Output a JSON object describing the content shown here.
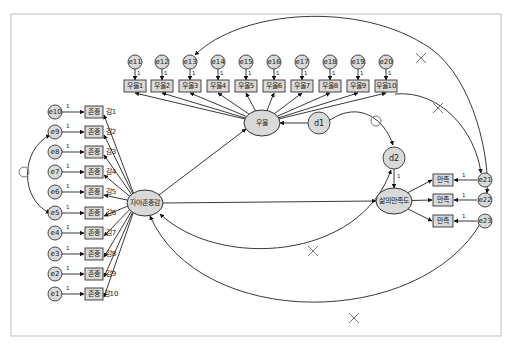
{
  "diagram": {
    "type": "SEM path diagram",
    "latents": {
      "self_esteem": {
        "label": "자아존중감",
        "cx": 145,
        "cy": 203,
        "rx": 18,
        "ry": 13
      },
      "depression": {
        "label": "우울",
        "cx": 262,
        "cy": 123,
        "rx": 18,
        "ry": 13
      },
      "life_satisfaction": {
        "label": "삶의만족도",
        "cx": 394,
        "cy": 201,
        "rx": 18,
        "ry": 13
      }
    },
    "disturbances": {
      "d1": {
        "label": "d1",
        "cx": 319,
        "cy": 123,
        "r": 11
      },
      "d2": {
        "label": "d2",
        "cx": 394,
        "cy": 158,
        "r": 11
      }
    },
    "self_esteem_indicators": [
      {
        "item": "자아존중감1",
        "error": "e10",
        "y": 112
      },
      {
        "item": "자아존중감2",
        "error": "e9",
        "y": 132
      },
      {
        "item": "자아존중감3",
        "error": "e8",
        "y": 152
      },
      {
        "item": "자아존중감4",
        "error": "e7",
        "y": 172
      },
      {
        "item": "자아존중감5",
        "error": "e6",
        "y": 192
      },
      {
        "item": "자아존중감6",
        "error": "e5",
        "y": 213
      },
      {
        "item": "자아존중감7",
        "error": "e4",
        "y": 233
      },
      {
        "item": "자아존중감8",
        "error": "e3",
        "y": 254
      },
      {
        "item": "자아존중감9",
        "error": "e2",
        "y": 274
      },
      {
        "item": "자아존중감10",
        "error": "e1",
        "y": 294
      }
    ],
    "depression_indicators": [
      {
        "item": "우울1",
        "error": "e11",
        "x": 135
      },
      {
        "item": "우울2",
        "error": "e12",
        "x": 162
      },
      {
        "item": "우울3",
        "error": "e13",
        "x": 190
      },
      {
        "item": "우울4",
        "error": "e14",
        "x": 218
      },
      {
        "item": "우울5",
        "error": "e15",
        "x": 246
      },
      {
        "item": "우울6",
        "error": "e16",
        "x": 274
      },
      {
        "item": "우울7",
        "error": "e17",
        "x": 302
      },
      {
        "item": "우울8",
        "error": "e18",
        "x": 330
      },
      {
        "item": "우울9",
        "error": "e19",
        "x": 358
      },
      {
        "item": "우울10",
        "error": "e20",
        "x": 386
      }
    ],
    "life_satisfaction_indicators": [
      {
        "item": "삶의만족1",
        "error": "e21",
        "y": 180
      },
      {
        "item": "삶의만족2",
        "error": "e22",
        "y": 200
      },
      {
        "item": "삶의만족3",
        "error": "e23",
        "y": 221
      }
    ],
    "fixed_loading_label": "1",
    "structural_paths": [
      {
        "from": "자아존중감",
        "to": "우울"
      },
      {
        "from": "자아존중감",
        "to": "삶의만족도"
      },
      {
        "from": "d1",
        "to": "우울"
      },
      {
        "from": "d2",
        "to": "삶의만족도"
      }
    ],
    "covariances": [
      {
        "between": [
          "e9",
          "e5"
        ],
        "marker": "circle"
      },
      {
        "between": [
          "d1",
          "d2"
        ],
        "marker": "circle"
      },
      {
        "between": [
          "자아존중감",
          "d2"
        ],
        "marker": "x"
      },
      {
        "between": [
          "자아존중감",
          "e23"
        ],
        "marker": "x"
      },
      {
        "between": [
          "e13",
          "e22"
        ],
        "marker": "x"
      },
      {
        "between": [
          "우울10",
          "e21"
        ],
        "marker": "x"
      }
    ],
    "colors": {
      "node_fill": "#d9d9d9",
      "line": "#222222",
      "marker": "#777777",
      "frame": "#c8c8c8"
    }
  }
}
